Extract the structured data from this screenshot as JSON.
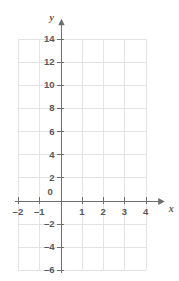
{
  "chart_data": {
    "type": "scatter",
    "title": "",
    "xlabel": "x",
    "ylabel": "y",
    "series": [],
    "x": [],
    "values": [],
    "xlim": [
      -2,
      4
    ],
    "ylim": [
      -6,
      14
    ],
    "x_ticks": [
      -2,
      -1,
      0,
      1,
      2,
      3,
      4
    ],
    "y_ticks": [
      -6,
      -4,
      -2,
      0,
      2,
      4,
      6,
      8,
      10,
      12,
      14
    ],
    "x_tick_labels": [
      "–2",
      "–1",
      "0",
      "1",
      "2",
      "3",
      "4"
    ],
    "y_tick_labels": [
      "–6",
      "–4",
      "–2",
      "2",
      "4",
      "6",
      "8",
      "10",
      "12",
      "14"
    ],
    "x_gridline_step": 1,
    "y_gridline_step": 2,
    "grid": true,
    "legend": "none",
    "origin_label": "0",
    "x_axis_arrow": true,
    "y_axis_arrow": true,
    "colors": {
      "grid": "#e3e3e3",
      "axis": "#6e6e70",
      "text": "#58585a",
      "background": "#ffffff"
    }
  },
  "axis_names": {
    "x": "x",
    "y": "y"
  },
  "y_axis_labels": [
    {
      "text": "14",
      "value": 14
    },
    {
      "text": "12",
      "value": 12
    },
    {
      "text": "10",
      "value": 10
    },
    {
      "text": "8",
      "value": 8
    },
    {
      "text": "6",
      "value": 6
    },
    {
      "text": "4",
      "value": 4
    },
    {
      "text": "2",
      "value": 2
    },
    {
      "text": "–2",
      "value": -2
    },
    {
      "text": "–4",
      "value": -4
    },
    {
      "text": "–6",
      "value": -6
    }
  ],
  "x_axis_labels": [
    {
      "text": "–2",
      "value": -2
    },
    {
      "text": "–1",
      "value": -1
    },
    {
      "text": "1",
      "value": 1
    },
    {
      "text": "2",
      "value": 2
    },
    {
      "text": "3",
      "value": 3
    },
    {
      "text": "4",
      "value": 4
    }
  ],
  "origin": {
    "text": "0"
  }
}
